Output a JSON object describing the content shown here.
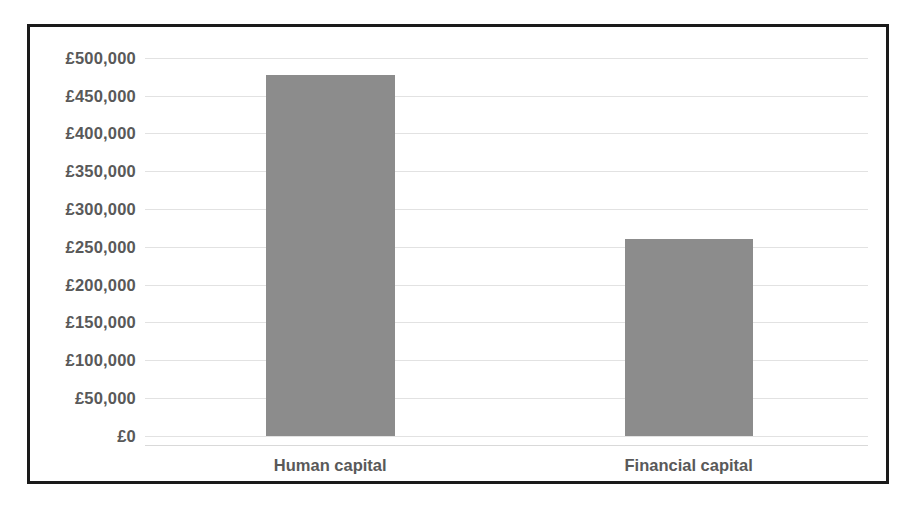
{
  "chart_data": {
    "type": "bar",
    "title": "",
    "subtitle": "",
    "xlabel": "",
    "ylabel": "",
    "categories": [
      "Human capital",
      "Financial capital"
    ],
    "values": [
      477500,
      260000
    ],
    "series": [
      {
        "name": "Capital",
        "values": [
          477500,
          260000
        ],
        "color": "#8c8c8c"
      }
    ],
    "ylim": [
      0,
      500000
    ],
    "ytick_step": 50000,
    "ytick_labels": [
      "£500,000",
      "£450,000",
      "£400,000",
      "£350,000",
      "£300,000",
      "£250,000",
      "£200,000",
      "£150,000",
      "£100,000",
      "£50,000",
      "£0"
    ],
    "ytick_values": [
      500000,
      450000,
      400000,
      350000,
      300000,
      250000,
      200000,
      150000,
      100000,
      50000,
      0
    ],
    "currency_symbol": "£",
    "grid": true,
    "grid_axis": "y",
    "legend": false,
    "legend_position": "none",
    "annotations": []
  },
  "style": {
    "plot_background": "#ffffff",
    "page_background": "#ffffff",
    "border_color": "#1a1a1a",
    "gridline_color": "#e2e2e2",
    "bar_color": "#8c8c8c",
    "label_color": "#595959",
    "category_axis_color": "#d9d9d9"
  }
}
